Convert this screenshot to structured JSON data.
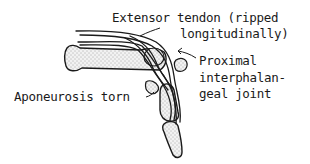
{
  "diagram": {
    "labels": {
      "extensor_tendon_line1": "Extensor tendon (ripped",
      "extensor_tendon_line2": "longitudinally)",
      "pip_joint_line1": "Proximal",
      "pip_joint_line2": "interphalan-",
      "pip_joint_line3": "geal joint",
      "aponeurosis": "Aponeurosis torn"
    },
    "colors": {
      "ink": "#1a1a1a",
      "bone_fill": "#ececec",
      "background": "#ffffff"
    }
  }
}
